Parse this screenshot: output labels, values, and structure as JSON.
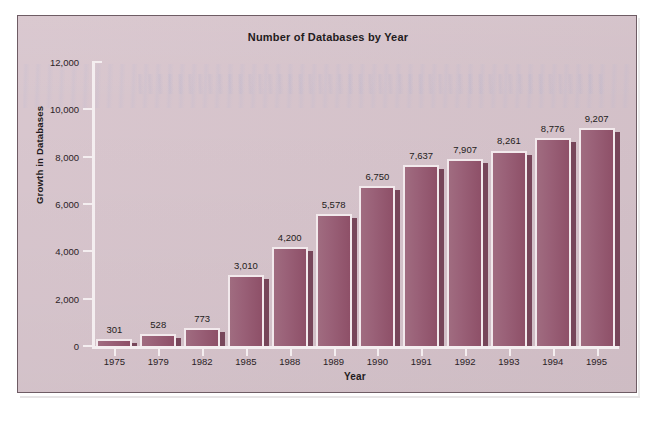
{
  "chart_data": {
    "type": "bar",
    "title": "Number of Databases by Year",
    "xlabel": "Year",
    "ylabel": "Growth in Databases",
    "categories": [
      "1975",
      "1979",
      "1982",
      "1985",
      "1988",
      "1989",
      "1990",
      "1991",
      "1992",
      "1993",
      "1994",
      "1995"
    ],
    "values": [
      301,
      528,
      773,
      3010,
      4200,
      5578,
      6750,
      7637,
      7907,
      8261,
      8776,
      9207
    ],
    "value_labels": [
      "301",
      "528",
      "773",
      "3,010",
      "4,200",
      "5,578",
      "6,750",
      "7,637",
      "7,907",
      "8,261",
      "8,776",
      "9,207"
    ],
    "ylim": [
      0,
      12000
    ],
    "yticks": [
      0,
      2000,
      4000,
      6000,
      8000,
      10000,
      12000
    ],
    "ytick_labels": [
      "0",
      "2,000",
      "4,000",
      "6,000",
      "8,000",
      "10,000",
      "12,000"
    ],
    "grid": false,
    "legend": null,
    "colors": {
      "background": "#d7c4cc",
      "bar_fill": "#9a6178",
      "bar_highlight": "#f2e9ec",
      "bar_shadow": "#77465a",
      "axis": "#f4eef0",
      "text": "#231b20",
      "frame_border": "#6e5c64"
    }
  }
}
